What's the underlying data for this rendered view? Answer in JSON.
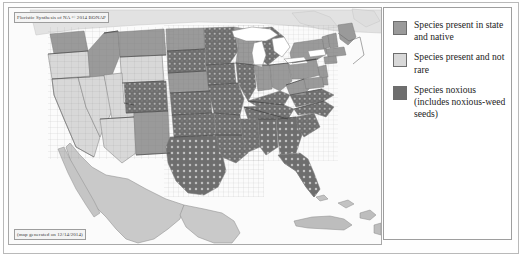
{
  "figure": {
    "kind": "distribution-map",
    "width": 524,
    "height": 260
  },
  "map": {
    "title_label": "Floristic Synthesis of NA © 2014 BONAP",
    "caption_label": "(map generated on 12/14/2014)",
    "region": "Contiguous United States (county level)",
    "colors": {
      "ocean": "#fbfbfb",
      "lakes": "#ffffff",
      "present_native": "#9a9a9a",
      "present_not_rare": "#d8d8d8",
      "noxious": "#6e6e6e",
      "outside_us": "#c9c9c9",
      "county_line": "#7e7e7e",
      "state_line": "#3a3a3a"
    }
  },
  "legend": {
    "items": [
      {
        "swatch_color": "#9a9a9a",
        "label": "Species present in state and native"
      },
      {
        "swatch_color": "#d8d8d8",
        "label": "Species present and not rare"
      },
      {
        "swatch_color": "#6e6e6e",
        "label": "Species noxious (includes noxious-weed seeds)"
      }
    ]
  },
  "map_regions": {
    "note": "Per-state shading class read from the pixels: light = present and not rare, medium = present in state and native, dark = noxious.",
    "states": [
      {
        "name": "Washington",
        "class": "present_native"
      },
      {
        "name": "Oregon",
        "class": "present_not_rare"
      },
      {
        "name": "California",
        "class": "present_not_rare"
      },
      {
        "name": "Idaho",
        "class": "present_native"
      },
      {
        "name": "Nevada",
        "class": "present_not_rare"
      },
      {
        "name": "Montana",
        "class": "present_native"
      },
      {
        "name": "Wyoming",
        "class": "present_not_rare"
      },
      {
        "name": "Utah",
        "class": "present_not_rare"
      },
      {
        "name": "Arizona",
        "class": "present_not_rare"
      },
      {
        "name": "Colorado",
        "class": "noxious"
      },
      {
        "name": "New Mexico",
        "class": "present_native"
      },
      {
        "name": "North Dakota",
        "class": "present_native"
      },
      {
        "name": "South Dakota",
        "class": "noxious"
      },
      {
        "name": "Nebraska",
        "class": "present_native"
      },
      {
        "name": "Kansas",
        "class": "noxious"
      },
      {
        "name": "Oklahoma",
        "class": "noxious"
      },
      {
        "name": "Texas",
        "class": "noxious"
      },
      {
        "name": "Minnesota",
        "class": "noxious"
      },
      {
        "name": "Iowa",
        "class": "noxious"
      },
      {
        "name": "Missouri",
        "class": "noxious"
      },
      {
        "name": "Arkansas",
        "class": "noxious"
      },
      {
        "name": "Louisiana",
        "class": "noxious"
      },
      {
        "name": "Wisconsin",
        "class": "present_native"
      },
      {
        "name": "Illinois",
        "class": "noxious"
      },
      {
        "name": "Michigan",
        "class": "noxious"
      },
      {
        "name": "Indiana",
        "class": "present_native"
      },
      {
        "name": "Ohio",
        "class": "present_native"
      },
      {
        "name": "Kentucky",
        "class": "noxious"
      },
      {
        "name": "Tennessee",
        "class": "noxious"
      },
      {
        "name": "Mississippi",
        "class": "noxious"
      },
      {
        "name": "Alabama",
        "class": "noxious"
      },
      {
        "name": "Georgia",
        "class": "noxious"
      },
      {
        "name": "Florida",
        "class": "noxious"
      },
      {
        "name": "South Carolina",
        "class": "noxious"
      },
      {
        "name": "North Carolina",
        "class": "noxious"
      },
      {
        "name": "Virginia",
        "class": "noxious"
      },
      {
        "name": "West Virginia",
        "class": "present_native"
      },
      {
        "name": "Pennsylvania",
        "class": "present_native"
      },
      {
        "name": "New York",
        "class": "present_native"
      },
      {
        "name": "Maine",
        "class": "present_native"
      },
      {
        "name": "Vermont",
        "class": "present_native"
      },
      {
        "name": "New Hampshire",
        "class": "present_native"
      },
      {
        "name": "Massachusetts",
        "class": "present_native"
      },
      {
        "name": "Connecticut",
        "class": "present_native"
      },
      {
        "name": "Rhode Island",
        "class": "present_native"
      },
      {
        "name": "New Jersey",
        "class": "present_native"
      },
      {
        "name": "Delaware",
        "class": "present_native"
      },
      {
        "name": "Maryland",
        "class": "present_native"
      }
    ]
  }
}
